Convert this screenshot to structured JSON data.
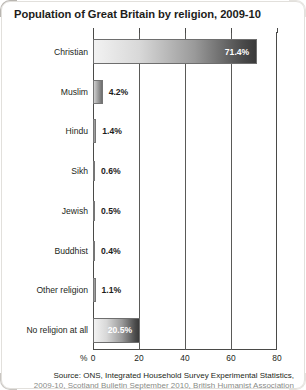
{
  "title": "Population of Great Britain by religion, 2009-10",
  "source": {
    "line1": "Source: ONS, Integrated Household Survey Experimental Statistics,",
    "line2": "2009-10, Scotland Bulletin September 2010, British Humanist Association"
  },
  "axis": {
    "percent_symbol": "%",
    "ticks": [
      "0",
      "20",
      "40",
      "60",
      "80"
    ]
  },
  "colors": {
    "bar_light": "#f2f2f2",
    "bar_dark": "#3a3a3a",
    "text": "#231f20",
    "axis": "#4a4a48",
    "page_background": "#d8d6d2",
    "card_background": "#ffffff"
  },
  "chart_data": {
    "type": "bar",
    "orientation": "horizontal",
    "title": "Population of Great Britain by religion, 2009-10",
    "xlabel": "%",
    "ylabel": "",
    "xlim": [
      0,
      80
    ],
    "xticks": [
      0,
      20,
      40,
      60,
      80
    ],
    "grid": true,
    "legend": false,
    "categories": [
      "Christian",
      "Muslim",
      "Hindu",
      "Sikh",
      "Jewish",
      "Buddhist",
      "Other religion",
      "No religion at all"
    ],
    "values": [
      71.4,
      4.2,
      1.4,
      0.6,
      0.5,
      0.4,
      1.1,
      20.5
    ],
    "data_labels": [
      "71.4%",
      "4.2%",
      "1.4%",
      "0.6%",
      "0.5%",
      "0.4%",
      "1.1%",
      "20.5%"
    ],
    "label_placement": [
      "inside",
      "outside",
      "outside",
      "outside",
      "outside",
      "outside",
      "outside",
      "inside"
    ]
  }
}
